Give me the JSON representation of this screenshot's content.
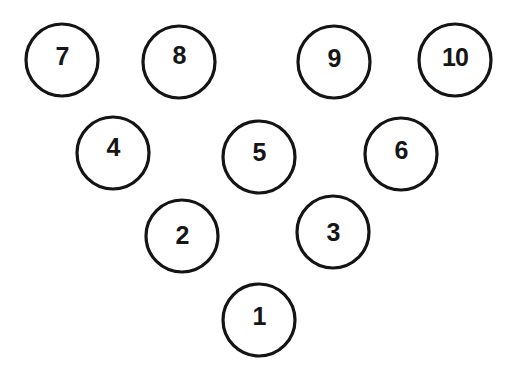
{
  "diagram": {
    "rows": [
      {
        "row": 4,
        "pins": [
          "7",
          "8",
          "9",
          "10"
        ]
      },
      {
        "row": 3,
        "pins": [
          "4",
          "5",
          "6"
        ]
      },
      {
        "row": 2,
        "pins": [
          "2",
          "3"
        ]
      },
      {
        "row": 1,
        "pins": [
          "1"
        ]
      }
    ],
    "pins": [
      {
        "id": "7",
        "label": "7"
      },
      {
        "id": "8",
        "label": "8"
      },
      {
        "id": "9",
        "label": "9"
      },
      {
        "id": "10",
        "label": "10"
      },
      {
        "id": "4",
        "label": "4"
      },
      {
        "id": "5",
        "label": "5"
      },
      {
        "id": "6",
        "label": "6"
      },
      {
        "id": "2",
        "label": "2"
      },
      {
        "id": "3",
        "label": "3"
      },
      {
        "id": "1",
        "label": "1"
      }
    ],
    "colors": {
      "ring": "#141414",
      "label": "#161616",
      "background": "#ffffff"
    }
  }
}
